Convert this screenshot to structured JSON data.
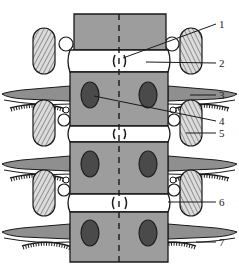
{
  "figure": {
    "caption": "",
    "width": 239,
    "height": 270,
    "background": "#ffffff",
    "ink": "#1a1a1a"
  },
  "palette": {
    "background": "#ffffff",
    "outline": "#1a1a1a",
    "vertebral_body_fill": "#9d9d9d",
    "disc_fill": "#ffffff",
    "pedicle_fill": "#4a4a4a",
    "rib_fill": "#8f8f8f",
    "process_fill": "#d8d8d8",
    "hatch_stroke": "#555555",
    "leader_stroke": "#1a1a1a",
    "midline_stroke": "#1a1a1a"
  },
  "labels": [
    {
      "id": 1,
      "text": "1",
      "x": 222,
      "y": 27,
      "target_x": 123,
      "target_y": 58,
      "leader": "diagonal"
    },
    {
      "id": 2,
      "text": "2",
      "x": 222,
      "y": 67,
      "target_x": 146,
      "target_y": 62,
      "leader": "horizontal"
    },
    {
      "id": 3,
      "text": "3",
      "x": 222,
      "y": 98,
      "target_x": 190,
      "target_y": 96,
      "leader": "horizontal"
    },
    {
      "id": 4,
      "text": "4",
      "x": 222,
      "y": 124,
      "target_x": 94,
      "target_y": 96,
      "leader": "diagonal"
    },
    {
      "id": 5,
      "text": "5",
      "x": 222,
      "y": 136,
      "target_x": 186,
      "target_y": 133,
      "leader": "horizontal"
    },
    {
      "id": 6,
      "text": "6",
      "x": 222,
      "y": 205,
      "target_x": 168,
      "target_y": 205,
      "leader": "horizontal"
    },
    {
      "id": 7,
      "text": "7",
      "x": 222,
      "y": 245,
      "target_x": 196,
      "target_y": 243,
      "leader": "horizontal"
    }
  ],
  "structures": {
    "midline": {
      "name": "vertical-dashed-midline",
      "x": 119,
      "y1": 14,
      "y2": 262
    },
    "vertebral_bodies": [
      {
        "index": 1,
        "x": 74,
        "y": 14,
        "w": 92,
        "h": 36
      },
      {
        "index": 2,
        "x": 70,
        "y": 72,
        "w": 98,
        "h": 54
      },
      {
        "index": 3,
        "x": 70,
        "y": 142,
        "w": 98,
        "h": 52
      },
      {
        "index": 4,
        "x": 70,
        "y": 212,
        "w": 98,
        "h": 50
      }
    ],
    "discs": [
      {
        "index": 1,
        "x": 70,
        "y": 50,
        "w": 98,
        "h": 22,
        "mark": "()"
      },
      {
        "index": 2,
        "x": 70,
        "y": 126,
        "w": 98,
        "h": 16,
        "mark": "()"
      },
      {
        "index": 3,
        "x": 70,
        "y": 194,
        "w": 98,
        "h": 18,
        "mark": "()"
      }
    ],
    "pedicles": [
      {
        "side": "left",
        "cx": 90,
        "cy": 95,
        "rx": 9,
        "ry": 13
      },
      {
        "side": "right",
        "cx": 148,
        "cy": 95,
        "rx": 9,
        "ry": 13
      },
      {
        "side": "left",
        "cx": 90,
        "cy": 164,
        "rx": 9,
        "ry": 13
      },
      {
        "side": "right",
        "cx": 148,
        "cy": 164,
        "rx": 9,
        "ry": 13
      },
      {
        "side": "left",
        "cx": 90,
        "cy": 233,
        "rx": 9,
        "ry": 13
      },
      {
        "side": "right",
        "cx": 148,
        "cy": 233,
        "rx": 9,
        "ry": 13
      }
    ],
    "transverse_processes": [
      {
        "side": "left",
        "x": 33,
        "y": 28,
        "w": 22,
        "h": 46
      },
      {
        "side": "right",
        "x": 180,
        "y": 28,
        "w": 22,
        "h": 46
      },
      {
        "side": "left",
        "x": 33,
        "y": 100,
        "w": 22,
        "h": 46
      },
      {
        "side": "right",
        "x": 180,
        "y": 100,
        "w": 22,
        "h": 46
      },
      {
        "side": "left",
        "x": 33,
        "y": 170,
        "w": 22,
        "h": 46
      },
      {
        "side": "right",
        "x": 180,
        "y": 170,
        "w": 22,
        "h": 46
      }
    ],
    "foramina_circles": [
      {
        "side": "left",
        "cx": 66,
        "cy": 44,
        "r": 7
      },
      {
        "side": "right",
        "cx": 172,
        "cy": 44,
        "r": 7
      },
      {
        "side": "left",
        "cx": 66,
        "cy": 120,
        "r": 6
      },
      {
        "side": "right",
        "cx": 172,
        "cy": 120,
        "r": 6
      },
      {
        "side": "left",
        "cx": 66,
        "cy": 190,
        "r": 6
      },
      {
        "side": "right",
        "cx": 172,
        "cy": 190,
        "r": 6
      }
    ],
    "ribs": [
      {
        "side": "left",
        "y": 93
      },
      {
        "side": "right",
        "y": 93
      },
      {
        "side": "left",
        "y": 163
      },
      {
        "side": "right",
        "y": 163
      },
      {
        "side": "left",
        "y": 231
      },
      {
        "side": "right",
        "y": 231
      }
    ],
    "serrated_arcs": [
      {
        "side": "left",
        "y": 110
      },
      {
        "side": "right",
        "y": 110
      },
      {
        "side": "left",
        "y": 180
      },
      {
        "side": "right",
        "y": 180
      },
      {
        "side": "left",
        "y": 248
      },
      {
        "side": "right",
        "y": 248
      }
    ]
  }
}
